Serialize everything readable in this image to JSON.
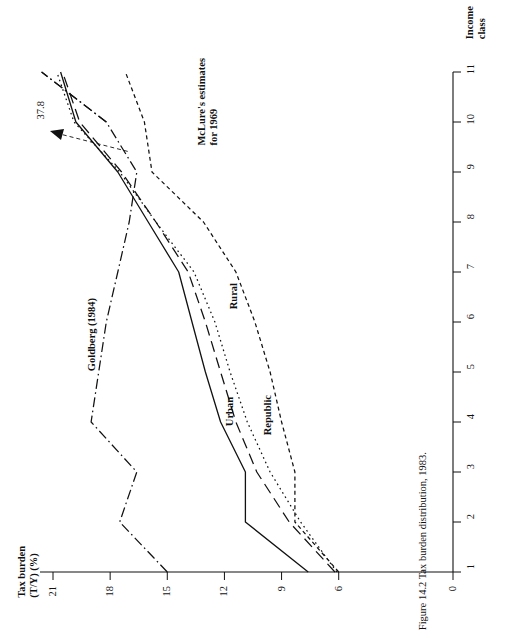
{
  "figure": {
    "caption": "Figure 14.2   Tax burden distribution, 1983.",
    "orientation": "rotated-90-ccw",
    "background": "#ffffff",
    "ink_color": "#111111"
  },
  "axes": {
    "value_axis": {
      "title_line1": "Tax burden",
      "title_line2": "(T/Y) (%)",
      "ticks": [
        "21",
        "18",
        "15",
        "12",
        "9",
        "6",
        "0"
      ],
      "tick_values": [
        21,
        18,
        15,
        12,
        9,
        6,
        0
      ],
      "range": [
        0,
        22
      ]
    },
    "category_axis": {
      "title_line1": "Income",
      "title_line2": "class",
      "ticks": [
        "1",
        "2",
        "3",
        "4",
        "5",
        "6",
        "7",
        "8",
        "9",
        "10",
        "11"
      ],
      "tick_values": [
        1,
        2,
        3,
        4,
        5,
        6,
        7,
        8,
        9,
        10,
        11
      ],
      "range": [
        1,
        11
      ]
    }
  },
  "annotations": [
    {
      "name": "overflow-value",
      "text": "37.8"
    }
  ],
  "series_labels": {
    "urban": "Urban",
    "republic": "Republic",
    "rural": "Rural",
    "mclure": "McLure's estimates\nfor 1969",
    "mclure_line1": "McLure's estimates",
    "mclure_line2": "for 1969",
    "goldberg": "Goldberg (1984)"
  },
  "chart_data": {
    "type": "line",
    "title": "Tax burden distribution, 1983.",
    "xlabel": "Income class",
    "ylabel": "Tax burden (T/Y) (%)",
    "orientation": "rotated 90 degrees counter-clockwise (y-axis runs horizontally at bottom, x-axis runs vertically at right)",
    "x": [
      1,
      2,
      3,
      4,
      5,
      6,
      7,
      8,
      9,
      10,
      11
    ],
    "xlim": [
      1,
      11
    ],
    "ylim": [
      0,
      22
    ],
    "grid": false,
    "legend": "inline labels on curves",
    "xticks": [
      1,
      2,
      3,
      4,
      5,
      6,
      7,
      8,
      9,
      10,
      11
    ],
    "yticks": [
      0,
      6,
      9,
      12,
      15,
      18,
      21
    ],
    "annotations": [
      {
        "text": "37.8",
        "note": "arrow marking off-scale value of Goldberg series at top income class"
      }
    ],
    "series": [
      {
        "name": "Urban",
        "style": "solid",
        "values": [
          7.6,
          10.9,
          10.9,
          12.2,
          13.0,
          13.7,
          14.4,
          16.0,
          17.6,
          19.8,
          20.6
        ]
      },
      {
        "name": "Republic",
        "style": "long-dash",
        "values": [
          6.2,
          8.6,
          10.3,
          11.4,
          12.2,
          13.0,
          13.9,
          15.6,
          17.4,
          19.6,
          20.5
        ]
      },
      {
        "name": "Rural",
        "style": "dotted",
        "values": [
          6.1,
          8.0,
          9.6,
          10.8,
          11.7,
          12.5,
          13.6,
          15.6,
          17.5,
          19.9,
          20.8
        ]
      },
      {
        "name": "McLure's estimates for 1969",
        "style": "short-dash",
        "values": [
          6.0,
          8.3,
          8.3,
          9.0,
          9.6,
          10.4,
          11.4,
          13.1,
          15.8,
          16.2,
          17.2
        ]
      },
      {
        "name": "Goldberg (1984)",
        "style": "dash-dot",
        "values": [
          15.0,
          17.5,
          16.6,
          19.0,
          18.6,
          18.2,
          17.6,
          17.0,
          16.6,
          18.2,
          37.8
        ]
      }
    ]
  }
}
